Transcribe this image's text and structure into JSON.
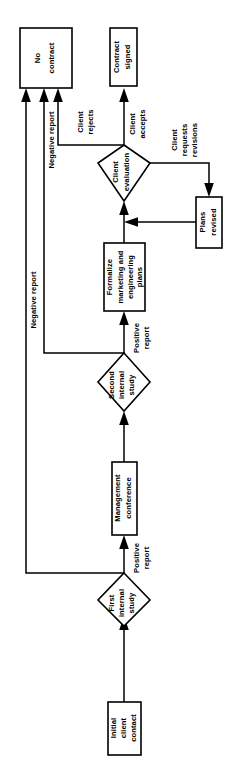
{
  "diagram": {
    "orientation": "rotated-90-counterclockwise",
    "background_color": "#ffffff",
    "line_color": "#000000",
    "node_fill": "#ffffff",
    "nodes": [
      {
        "id": "no-contract",
        "shape": "box",
        "label": "No contract"
      },
      {
        "id": "contract-signed",
        "shape": "box",
        "label": "Contract signed"
      },
      {
        "id": "client-evaluation",
        "shape": "diamond",
        "label": "Client evaluation"
      },
      {
        "id": "plans-revised",
        "shape": "box",
        "label": "Plans revised"
      },
      {
        "id": "formalize-plans",
        "shape": "box",
        "label": "Formalize marketing and engineering plans"
      },
      {
        "id": "second-internal-study",
        "shape": "diamond",
        "label": "Second internal study"
      },
      {
        "id": "management-conference",
        "shape": "box",
        "label": "Management conference"
      },
      {
        "id": "first-internal-study",
        "shape": "diamond",
        "label": "First internal study"
      },
      {
        "id": "initial-client-contact",
        "shape": "box",
        "label": "Initial client contact"
      }
    ],
    "node_labels": {
      "no_contract": [
        "No",
        "contract"
      ],
      "contract_signed": [
        "Contract",
        "signed"
      ],
      "client_evaluation": [
        "Client",
        "evaluation"
      ],
      "plans_revised": [
        "Plans",
        "revised"
      ],
      "formalize_plans": [
        "Formalize",
        "marketing and",
        "engineering",
        "plans"
      ],
      "second_internal_study": [
        "Second",
        "internal",
        "study"
      ],
      "management_conference": [
        "Management",
        "conference"
      ],
      "first_internal_study": [
        "First",
        "internal",
        "study"
      ],
      "initial_client_contact": [
        "Initial",
        "client",
        "contact"
      ]
    },
    "edge_labels": {
      "negative_report": "Negative report",
      "negative_report_2": "Negative report",
      "client_rejects": [
        "Client",
        "rejects"
      ],
      "client_accepts": [
        "Client",
        "accepts"
      ],
      "client_requests_revisions": [
        "Client",
        "requests",
        "revisions"
      ],
      "positive_report_upper": [
        "Positive",
        "report"
      ],
      "positive_report_lower": [
        "Positive",
        "report"
      ]
    },
    "edges": [
      {
        "from": "initial-client-contact",
        "to": "first-internal-study",
        "label": ""
      },
      {
        "from": "first-internal-study",
        "to": "management-conference",
        "label": "Positive report"
      },
      {
        "from": "first-internal-study",
        "to": "no-contract",
        "label": "Negative report"
      },
      {
        "from": "management-conference",
        "to": "second-internal-study",
        "label": ""
      },
      {
        "from": "second-internal-study",
        "to": "formalize-plans",
        "label": "Positive report"
      },
      {
        "from": "second-internal-study",
        "to": "no-contract",
        "label": "Negative report"
      },
      {
        "from": "formalize-plans",
        "to": "client-evaluation",
        "label": ""
      },
      {
        "from": "client-evaluation",
        "to": "contract-signed",
        "label": "Client accepts"
      },
      {
        "from": "client-evaluation",
        "to": "no-contract",
        "label": "Client rejects"
      },
      {
        "from": "client-evaluation",
        "to": "plans-revised",
        "label": "Client requests revisions"
      },
      {
        "from": "plans-revised",
        "to": "client-evaluation",
        "label": ""
      }
    ]
  }
}
